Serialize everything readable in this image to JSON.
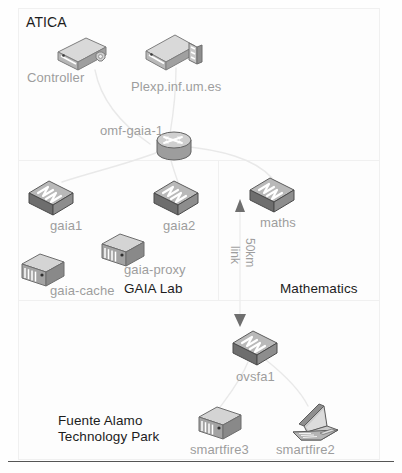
{
  "diagram": {
    "title": "ATICA",
    "bottom_rule": true,
    "zones": [
      {
        "id": "atica",
        "label": "ATICA",
        "label_x": 26,
        "label_y": 14,
        "x": 18,
        "y": 8,
        "w": 360,
        "h": 152,
        "label_color": "#1c1c1c"
      },
      {
        "id": "gaia-lab",
        "label": "GAIA Lab",
        "label_x": 124,
        "label_y": 281,
        "x": 18,
        "y": 160,
        "w": 200,
        "h": 140,
        "label_color": "#1c1c1c"
      },
      {
        "id": "mathematics",
        "label": "Mathematics",
        "label_x": 280,
        "label_y": 281,
        "x": 218,
        "y": 160,
        "w": 160,
        "h": 140,
        "label_color": "#1c1c1c"
      },
      {
        "id": "fuente",
        "label": "Fuente Alamo\nTechnology Park",
        "label_x": 58,
        "label_y": 413,
        "x": 18,
        "y": 300,
        "w": 360,
        "h": 158,
        "label_color": "#1c1c1c"
      }
    ],
    "nodes": [
      {
        "id": "controller",
        "label": "Controller",
        "icon": "server-box-icon",
        "icon_x": 52,
        "icon_y": 36,
        "label_x": 27,
        "label_y": 70
      },
      {
        "id": "plexp",
        "label": "Plexp.inf.um.es",
        "icon": "rack-server-icon",
        "icon_x": 142,
        "icon_y": 32,
        "label_x": 131,
        "label_y": 79
      },
      {
        "id": "omf-gaia-1",
        "label": "omf-gaia-1",
        "icon": "router-icon",
        "icon_x": 155,
        "icon_y": 130,
        "label_x": 100,
        "label_y": 123
      },
      {
        "id": "gaia1",
        "label": "gaia1",
        "icon": "switch-icon",
        "icon_x": 26,
        "icon_y": 178,
        "label_x": 50,
        "label_y": 218
      },
      {
        "id": "gaia2",
        "label": "gaia2",
        "icon": "switch-icon",
        "icon_x": 151,
        "icon_y": 178,
        "label_x": 163,
        "label_y": 218
      },
      {
        "id": "maths",
        "label": "maths",
        "icon": "switch-icon",
        "icon_x": 247,
        "icon_y": 175,
        "label_x": 260,
        "label_y": 215
      },
      {
        "id": "gaia-proxy",
        "label": "gaia-proxy",
        "icon": "tower-server-icon",
        "icon_x": 99,
        "icon_y": 232,
        "label_x": 124,
        "label_y": 262
      },
      {
        "id": "gaia-cache",
        "label": "gaia-cache",
        "icon": "tower-server-icon",
        "icon_x": 19,
        "icon_y": 252,
        "label_x": 50,
        "label_y": 283
      },
      {
        "id": "ovsfa1",
        "label": "ovsfa1",
        "icon": "switch-icon",
        "icon_x": 230,
        "icon_y": 328,
        "label_x": 236,
        "label_y": 369
      },
      {
        "id": "smartfire3",
        "label": "smartfire3",
        "icon": "tower-server-icon",
        "icon_x": 196,
        "icon_y": 405,
        "label_x": 190,
        "label_y": 442
      },
      {
        "id": "smartfire2",
        "label": "smartfire2",
        "icon": "laptop-icon",
        "icon_x": 290,
        "icon_y": 402,
        "label_x": 276,
        "label_y": 442
      }
    ],
    "links": [
      {
        "id": "controller-omf",
        "from": "controller",
        "to": "omf-gaia-1"
      },
      {
        "id": "plexp-omf",
        "from": "plexp",
        "to": "omf-gaia-1"
      },
      {
        "id": "omf-gaia1",
        "from": "omf-gaia-1",
        "to": "gaia1"
      },
      {
        "id": "omf-gaia2",
        "from": "omf-gaia-1",
        "to": "gaia2"
      },
      {
        "id": "omf-maths",
        "from": "omf-gaia-1",
        "to": "maths"
      },
      {
        "id": "maths-ovsfa1",
        "from": "maths",
        "to": "ovsfa1",
        "label_line1": "50km",
        "label_line2": "link",
        "bidirectional": true
      },
      {
        "id": "ovsfa1-smartfire3",
        "from": "ovsfa1",
        "to": "smartfire3"
      },
      {
        "id": "ovsfa1-smartfire2",
        "from": "ovsfa1",
        "to": "smartfire2"
      }
    ],
    "link_label": {
      "line1": "50km",
      "line2": "link",
      "line1_x": 258,
      "line1_y": 240,
      "line2_x": 243,
      "line2_y": 248
    },
    "colors": {
      "node_label": "#9d9d9d",
      "zone_label": "#1c1c1c",
      "zone_border": "#f0f0f0",
      "wire": "#e8e8e8",
      "arrow": "#6f6f6f",
      "icon_light": "#d8d8d8",
      "icon_mid": "#a8a8a8",
      "icon_dark": "#5f5f5f",
      "background": "#ffffff"
    }
  }
}
